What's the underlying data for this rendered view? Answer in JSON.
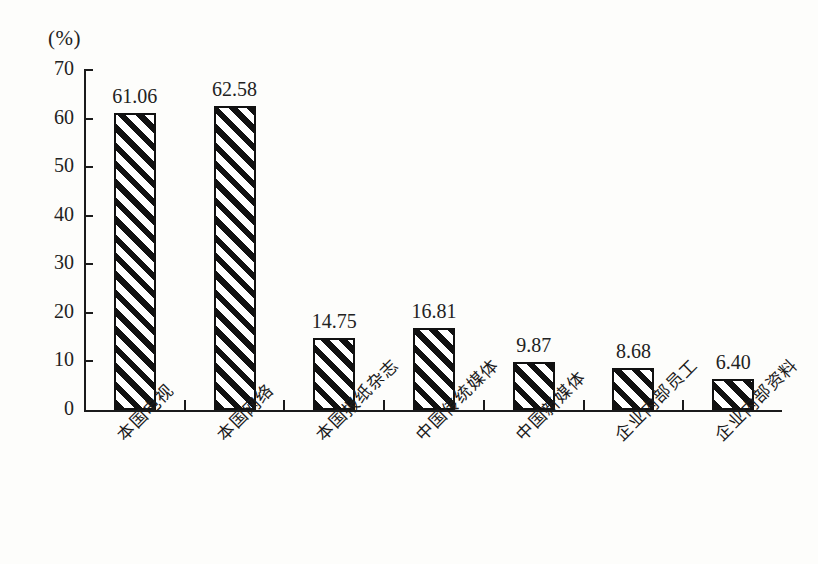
{
  "chart_data": {
    "type": "bar",
    "title": "",
    "subtitle": "",
    "unit_label": "(%)",
    "xlabel": "",
    "ylabel": "",
    "ylim": [
      0,
      70
    ],
    "y_ticks": [
      0,
      10,
      20,
      30,
      40,
      50,
      60,
      70
    ],
    "grid": false,
    "legend": false,
    "categories": [
      "本国电视",
      "本国网络",
      "本国报纸杂志",
      "中国传统媒体",
      "中国新媒体",
      "企业内部员工",
      "企业内部资料"
    ],
    "values": [
      61.06,
      62.58,
      14.75,
      16.81,
      9.87,
      8.68,
      6.4
    ],
    "value_labels": [
      "61.06",
      "62.58",
      "14.75",
      "16.81",
      "9.87",
      "8.68",
      "6.40"
    ],
    "series": [
      {
        "name": "",
        "values": [
          61.06,
          62.58,
          14.75,
          16.81,
          9.87,
          8.68,
          6.4
        ]
      }
    ],
    "style": {
      "bar_fill": "diagonal-hatch",
      "bar_outline": "#111111",
      "background": "#fdfdfb",
      "ink": "#1b1b1b"
    }
  }
}
